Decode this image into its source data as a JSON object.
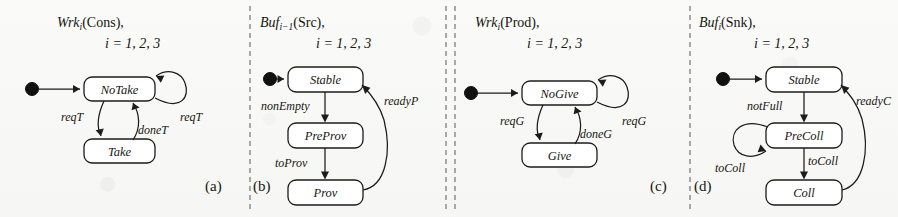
{
  "figure": {
    "width": 898,
    "height": 217,
    "kind": "state-machine-diagram-set",
    "background_color": "#fbfbfa",
    "ink_color": "#1c1c1c",
    "divider_color": "#6d6d6d"
  },
  "panels": [
    {
      "tag": "(a)",
      "title_main": "Wrk",
      "title_sub": "i",
      "title_rest": "(Cons),",
      "title_line2": "i = 1, 2, 3",
      "states": [
        {
          "name": "NoTake",
          "initial": true
        },
        {
          "name": "Take",
          "initial": false
        }
      ],
      "transitions": [
        {
          "from": "NoTake",
          "to": "Take",
          "label": "reqT"
        },
        {
          "from": "Take",
          "to": "NoTake",
          "label": "doneT"
        },
        {
          "from": "NoTake",
          "to": "NoTake",
          "label": "reqT",
          "self_loop": true
        }
      ]
    },
    {
      "tag": "(b)",
      "title_main": "Buf",
      "title_sub": "i−1",
      "title_rest": "(Src),",
      "title_line2": "i = 1, 2, 3",
      "states": [
        {
          "name": "Stable",
          "initial": true
        },
        {
          "name": "PreProv",
          "initial": false
        },
        {
          "name": "Prov",
          "initial": false
        }
      ],
      "transitions": [
        {
          "from": "Stable",
          "to": "PreProv",
          "label": "nonEmpty"
        },
        {
          "from": "PreProv",
          "to": "Prov",
          "label": "toProv"
        },
        {
          "from": "Prov",
          "to": "Stable",
          "label": "readyP"
        }
      ]
    },
    {
      "tag": "(c)",
      "title_main": "Wrk",
      "title_sub": "i",
      "title_rest": "(Prod),",
      "title_line2": "i = 1, 2, 3",
      "states": [
        {
          "name": "NoGive",
          "initial": true
        },
        {
          "name": "Give",
          "initial": false
        }
      ],
      "transitions": [
        {
          "from": "NoGive",
          "to": "Give",
          "label": "reqG"
        },
        {
          "from": "Give",
          "to": "NoGive",
          "label": "doneG"
        },
        {
          "from": "NoGive",
          "to": "NoGive",
          "label": "reqG",
          "self_loop": true
        }
      ]
    },
    {
      "tag": "(d)",
      "title_main": "Buf",
      "title_sub": "i",
      "title_rest": "(Snk),",
      "title_line2": "i = 1, 2, 3",
      "states": [
        {
          "name": "Stable",
          "initial": true
        },
        {
          "name": "PreColl",
          "initial": false
        },
        {
          "name": "Coll",
          "initial": false
        }
      ],
      "transitions": [
        {
          "from": "Stable",
          "to": "PreColl",
          "label": "notFull"
        },
        {
          "from": "PreColl",
          "to": "PreColl",
          "label": "toColl",
          "self_loop": true
        },
        {
          "from": "PreColl",
          "to": "Coll",
          "label": "toColl"
        },
        {
          "from": "Coll",
          "to": "Stable",
          "label": "readyC"
        }
      ]
    }
  ],
  "dividers": [
    {
      "x": 250,
      "style": "dashed"
    },
    {
      "x": 446,
      "style": "dashed"
    },
    {
      "x": 455,
      "style": "dashed"
    },
    {
      "x": 690,
      "style": "dashed"
    }
  ]
}
